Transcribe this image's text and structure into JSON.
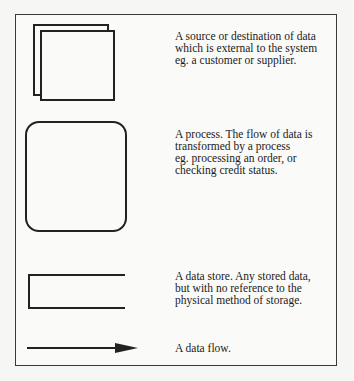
{
  "diagram": {
    "type": "data-flow-diagram-legend",
    "colors": {
      "stroke": "#222222",
      "frame": "#3a3a3a",
      "background": "#f6f6f4"
    },
    "items": [
      {
        "symbol": "external-entity",
        "shape": "two overlapping squares",
        "lines": [
          "A  source or destination of data",
          "which is external to the system",
          "eg. a customer or supplier."
        ]
      },
      {
        "symbol": "process",
        "shape": "rounded rectangle",
        "lines": [
          "A process. The flow of data is",
          "transformed by a process",
          "eg. processing an order, or",
          "checking credit status."
        ]
      },
      {
        "symbol": "data-store",
        "shape": "open-ended rectangle",
        "lines": [
          "A data store. Any stored data,",
          "but with no reference to the",
          "physical method of storage."
        ]
      },
      {
        "symbol": "data-flow",
        "shape": "arrow",
        "lines": [
          "A data flow."
        ]
      }
    ]
  }
}
